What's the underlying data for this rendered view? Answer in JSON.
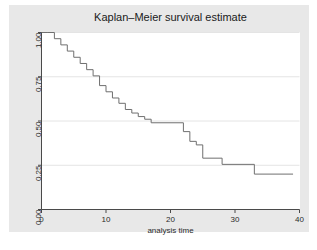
{
  "figure": {
    "background_color": "#ffffff",
    "graph_region_color": "#e8e8e8",
    "plot_panel_color": "#ffffff"
  },
  "chart_data": {
    "type": "line",
    "subtype": "step",
    "title": "Kaplan–Meier survival estimate",
    "xlabel": "analysis time",
    "ylabel": "",
    "xlim": [
      0,
      40
    ],
    "ylim": [
      0,
      1
    ],
    "xticks": [
      0,
      10,
      20,
      30,
      40
    ],
    "xtick_labels": [
      "0",
      "10",
      "20",
      "30",
      "40"
    ],
    "yticks": [
      0.0,
      0.25,
      0.5,
      0.75,
      1.0
    ],
    "ytick_labels": [
      "0.00",
      "0.25",
      "0.50",
      "0.75",
      "1.00"
    ],
    "grid": "horizontal",
    "gridline_color": "#e4e4e4",
    "legend": "none",
    "line_color": "#6f6f6f",
    "line_width": 1,
    "series": [
      {
        "name": "Kaplan-Meier survival estimate",
        "x": [
          0,
          1,
          2,
          3,
          4,
          5,
          6,
          7,
          8,
          9,
          10,
          11,
          12,
          13,
          14,
          15,
          16,
          17,
          22,
          23,
          24,
          25,
          28,
          33,
          39
        ],
        "y": [
          1.0,
          1.0,
          0.965,
          0.93,
          0.895,
          0.86,
          0.825,
          0.79,
          0.755,
          0.7,
          0.665,
          0.63,
          0.6,
          0.565,
          0.545,
          0.525,
          0.51,
          0.49,
          0.49,
          0.44,
          0.385,
          0.365,
          0.29,
          0.255,
          0.2
        ],
        "description": "Monotone decreasing step function from survival probability 1.00 at time 0 down to 0.20 at time 39"
      }
    ],
    "steps": [
      {
        "time": 0,
        "survival": 1.0
      },
      {
        "time": 1,
        "survival": 1.0
      },
      {
        "time": 2,
        "survival": 0.965
      },
      {
        "time": 3,
        "survival": 0.93
      },
      {
        "time": 4,
        "survival": 0.895
      },
      {
        "time": 5,
        "survival": 0.86
      },
      {
        "time": 6,
        "survival": 0.825
      },
      {
        "time": 7,
        "survival": 0.79
      },
      {
        "time": 8,
        "survival": 0.755
      },
      {
        "time": 9,
        "survival": 0.7
      },
      {
        "time": 10,
        "survival": 0.665
      },
      {
        "time": 11,
        "survival": 0.63
      },
      {
        "time": 12,
        "survival": 0.6
      },
      {
        "time": 13,
        "survival": 0.565
      },
      {
        "time": 14,
        "survival": 0.545
      },
      {
        "time": 15,
        "survival": 0.525
      },
      {
        "time": 16,
        "survival": 0.51
      },
      {
        "time": 17,
        "survival": 0.49
      },
      {
        "time": 22,
        "survival": 0.44
      },
      {
        "time": 23,
        "survival": 0.385
      },
      {
        "time": 24,
        "survival": 0.365
      },
      {
        "time": 25,
        "survival": 0.29
      },
      {
        "time": 28,
        "survival": 0.255
      },
      {
        "time": 33,
        "survival": 0.2
      },
      {
        "time": 39,
        "survival": 0.2
      }
    ]
  }
}
